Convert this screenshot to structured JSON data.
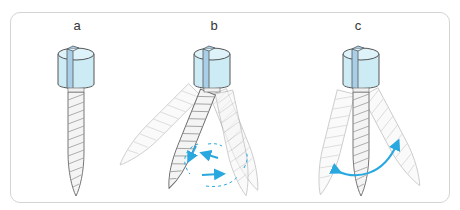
{
  "diagram": {
    "panels": [
      {
        "id": "a",
        "label": "a",
        "state": "static"
      },
      {
        "id": "b",
        "label": "b",
        "state": "circular-rotational-motion"
      },
      {
        "id": "c",
        "label": "c",
        "state": "pendular-rocking-motion"
      }
    ],
    "colors": {
      "head_fill": "#cdebf5",
      "head_top": "#ddf2f9",
      "slot": "#a9cfe8",
      "outline": "#555555",
      "shaft_fill": "#f4f4f4",
      "thread": "#9a9a9a",
      "arrow": "#29a8e0",
      "frame": "#d4d4d4"
    }
  }
}
